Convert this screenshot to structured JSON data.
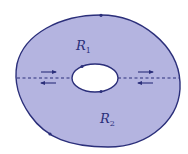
{
  "diagram": {
    "type": "annular region split by cross-cuts",
    "colors": {
      "region_fill": "#b4b4e0",
      "boundary": "#2b2f7a",
      "hole_fill": "#ffffff",
      "background": "#ffffff"
    },
    "labels": {
      "r1": {
        "main": "R",
        "sub": "1"
      },
      "r2": {
        "main": "R",
        "sub": "2"
      }
    },
    "outer_boundary": {
      "orientation": "counterclockwise",
      "arrow_marks": [
        "top",
        "bottom-left"
      ]
    },
    "inner_boundary": {
      "orientation": "clockwise",
      "arrow_marks": [
        "top-left",
        "bottom-right"
      ]
    },
    "cuts": [
      {
        "side": "left",
        "style": "dashed",
        "arrows": [
          "right (upper)",
          "left (lower)"
        ]
      },
      {
        "side": "right",
        "style": "dashed",
        "arrows": [
          "right (upper)",
          "left (lower)"
        ]
      }
    ]
  }
}
